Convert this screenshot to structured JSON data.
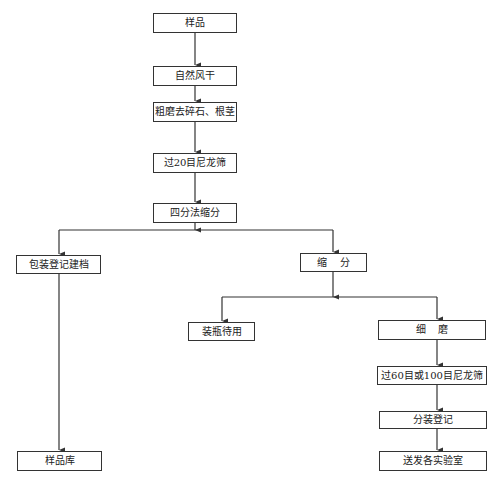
{
  "diagram": {
    "type": "flowchart",
    "nodes": {
      "sample": "样品",
      "air_dry": "自然风干",
      "coarse_grind": "粗磨去碎石、根茎",
      "sieve20": "过20目尼龙筛",
      "quartering": "四分法缩分",
      "package_register": "包装登记建档",
      "reduce": "缩    分",
      "bottle_store": "装瓶待用",
      "fine_grind": "细    磨",
      "sieve60_100": "过60目或100目尼龙筛",
      "split_register": "分装登记",
      "sample_library": "样品库",
      "send_labs": "送发各实验室"
    },
    "edges": [
      [
        "sample",
        "air_dry"
      ],
      [
        "air_dry",
        "coarse_grind"
      ],
      [
        "coarse_grind",
        "sieve20"
      ],
      [
        "sieve20",
        "quartering"
      ],
      [
        "quartering",
        "package_register"
      ],
      [
        "quartering",
        "reduce"
      ],
      [
        "package_register",
        "sample_library"
      ],
      [
        "reduce",
        "bottle_store"
      ],
      [
        "reduce",
        "fine_grind"
      ],
      [
        "fine_grind",
        "sieve60_100"
      ],
      [
        "sieve60_100",
        "split_register"
      ],
      [
        "split_register",
        "send_labs"
      ]
    ],
    "colors": {
      "line": "#333333",
      "box_fill": "#ffffff",
      "text": "#222222"
    }
  }
}
